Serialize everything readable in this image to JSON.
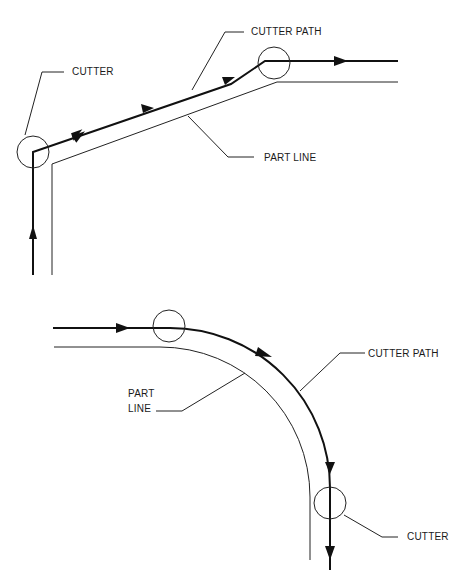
{
  "top_diagram": {
    "labels": {
      "cutter": "CUTTER",
      "cutter_path": "CUTTER PATH",
      "part_line": "PART LINE"
    }
  },
  "bottom_diagram": {
    "labels": {
      "part_line_1": "PART",
      "part_line_2": "LINE",
      "cutter_path": "CUTTER PATH",
      "cutter": "CUTTER"
    }
  },
  "colors": {
    "line": "#111111",
    "background": "#ffffff"
  }
}
